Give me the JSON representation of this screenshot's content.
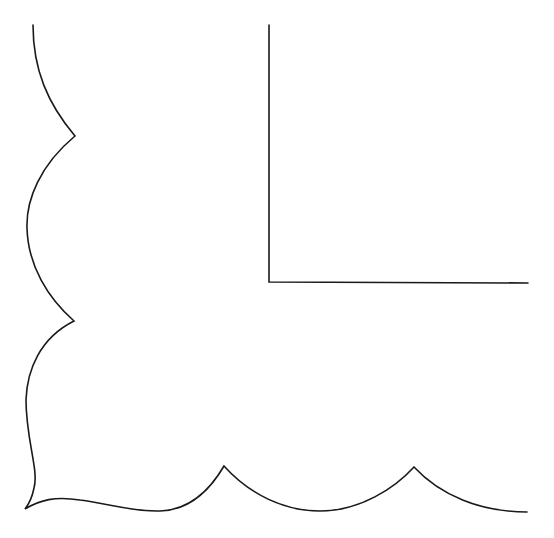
{
  "figure": {
    "stroke_color": "#1a1a1a",
    "background": "#ffffff",
    "inner_border": {
      "corner_x": 269,
      "top_y": 25,
      "corner_y": 282,
      "right_x": 528
    },
    "scallop_outline": {
      "left_cusps": [
        [
          75,
          136
        ],
        [
          74,
          321
        ]
      ],
      "corner_point": [
        25,
        509
      ],
      "bottom_cusps": [
        [
          224,
          466
        ],
        [
          414,
          467
        ]
      ],
      "start": [
        33,
        25
      ],
      "end": [
        527,
        512
      ]
    }
  }
}
